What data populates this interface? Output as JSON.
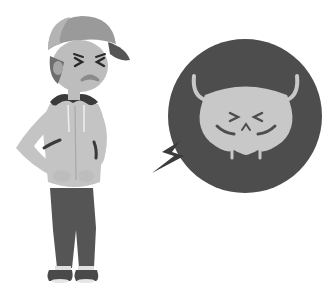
{
  "image": {
    "description": "Grayscale flat illustration of a young man in a cap and hoodie grimacing while clutching his lower abdomen, next to a dark circular bubble containing a pained bladder character with a lightning bolt pointing to it",
    "alt": "Man with bladder pain illustration"
  },
  "colors": {
    "background": "#ffffff",
    "bubble": "#4d4d4d",
    "bladder": "#c8c8c8",
    "cap_front": "#b4b4b4",
    "cap_back": "#9a9a9a",
    "cap_brim": "#555555",
    "skin": "#bdbdbd",
    "hair": "#6e6e6e",
    "hoodie": "#c4c4c4",
    "hood_lining": "#3a3a3a",
    "pants": "#555555",
    "shoes": "#4a4a4a",
    "bolt": "#3c3c3c"
  }
}
